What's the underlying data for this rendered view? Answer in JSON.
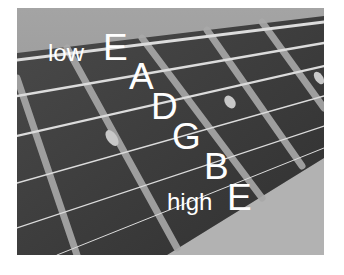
{
  "image": {
    "subject": "guitar-fretboard-photo",
    "description": "Close-up photo of guitar fretboard with strings labeled",
    "tone": "grayscale"
  },
  "labels": {
    "low_prefix": "low",
    "string6": "E",
    "string5": "A",
    "string4": "D",
    "string3": "G",
    "string2": "B",
    "high_prefix": "high",
    "string1": "E"
  },
  "colors": {
    "label_text": "#ffffff",
    "fretboard": "#3c3c3c",
    "background_top": "#9a9a9a",
    "background_bottom": "#b0b0b0",
    "string": "#d6d6d6",
    "fret": "#a8a8a8"
  }
}
